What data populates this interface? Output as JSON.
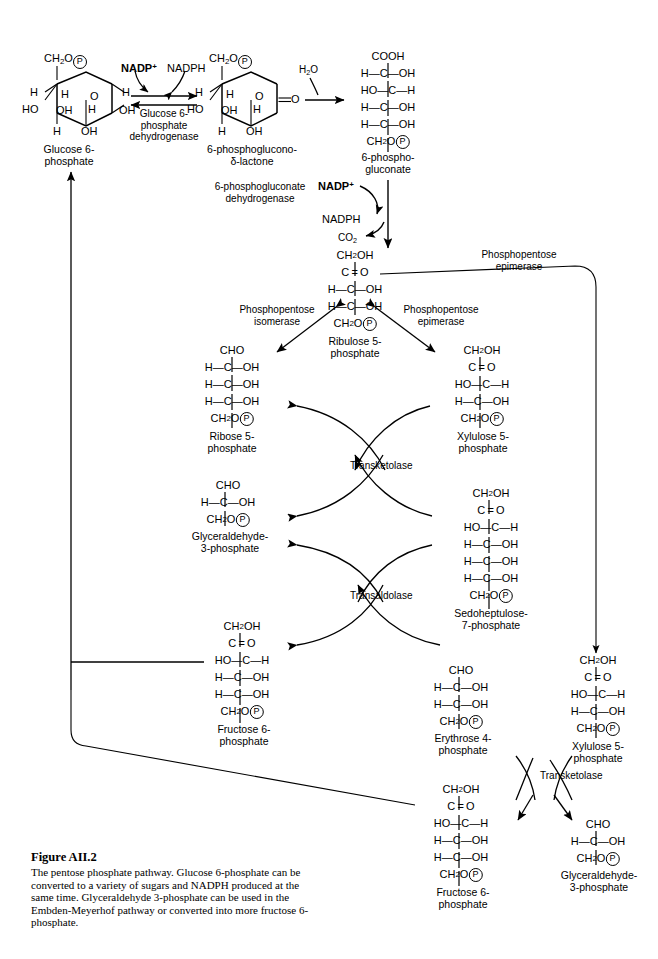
{
  "figure": {
    "number": "Figure AII.2",
    "caption": "The pentose phosphate pathway. Glucose 6-phosphate can be converted to a variety of sugars and NADPH produced at the same time. Glyceraldehyde 3-phosphate can be used in the Embden-Meyerhof pathway or converted into more fructose 6-phosphate."
  },
  "metabolites": {
    "glucose6p": {
      "name_line1": "Glucose 6-",
      "name_line2": "phosphate"
    },
    "lactone": {
      "name_line1": "6-phosphoglucono-",
      "name_line2": "δ-lactone"
    },
    "gluconate": {
      "name_line1": "6-phospho-",
      "name_line2": "gluconate",
      "rows": [
        "COOH",
        "H—C—OH",
        "HO—C—H",
        "H—C—OH",
        "H—C—OH",
        "CH2O-P"
      ]
    },
    "ribulose5p": {
      "name_line1": "Ribulose 5-",
      "name_line2": "phosphate",
      "rows": [
        "CH2OH",
        "C=O",
        "H—C—OH",
        "H—C—OH",
        "CH2O-P"
      ]
    },
    "ribose5p": {
      "name_line1": "Ribose 5-",
      "name_line2": "phosphate",
      "rows": [
        "CHO",
        "H—C—OH",
        "H—C—OH",
        "H—C—OH",
        "CH2O-P"
      ]
    },
    "xylulose5p_upper": {
      "name_line1": "Xylulose 5-",
      "name_line2": "phosphate",
      "rows": [
        "CH2OH",
        "C=O",
        "HO—C—H",
        "H—C—OH",
        "CH2O-P"
      ]
    },
    "g3p_mid": {
      "name_line1": "Glyceraldehyde-",
      "name_line2": "3-phosphate",
      "rows": [
        "CHO",
        "H—C—OH",
        "CH2O-P"
      ]
    },
    "sedoheptulose7p": {
      "name_line1": "Sedoheptulose-",
      "name_line2": "7-phosphate",
      "rows": [
        "CH2OH",
        "C=O",
        "HO—C—H",
        "H—C—OH",
        "H—C—OH",
        "H—C—OH",
        "CH2O-P"
      ]
    },
    "fructose6p_mid": {
      "name_line1": "Fructose 6-",
      "name_line2": "phosphate",
      "rows": [
        "CH2OH",
        "C=O",
        "HO—C—H",
        "H—C—OH",
        "H—C—OH",
        "CH2O-P"
      ]
    },
    "erythrose4p": {
      "name_line1": "Erythrose 4-",
      "name_line2": "phosphate",
      "rows": [
        "CHO",
        "H—C—OH",
        "H—C—OH",
        "CH2O-P"
      ]
    },
    "xylulose5p_lower": {
      "name_line1": "Xylulose 5-",
      "name_line2": "phosphate",
      "rows": [
        "CH2OH",
        "C=O",
        "HO—C—H",
        "H—C—OH",
        "CH2O-P"
      ]
    },
    "fructose6p_lower": {
      "name_line1": "Fructose 6-",
      "name_line2": "phosphate",
      "rows": [
        "CH2OH",
        "C=O",
        "HO—C—H",
        "H—C—OH",
        "H—C—OH",
        "CH2O-P"
      ]
    },
    "g3p_lower": {
      "name_line1": "Glyceraldehyde-",
      "name_line2": "3-phosphate",
      "rows": [
        "CHO",
        "H—C—OH",
        "CH2O-P"
      ]
    }
  },
  "enzymes": {
    "g6pdh_line1": "Glucose 6-",
    "g6pdh_line2": "phosphate",
    "g6pdh_line3": "dehydrogenase",
    "pgdh_line1": "6-phosphogluconate",
    "pgdh_line2": "dehydrogenase",
    "isomerase_line1": "Phosphopentose",
    "isomerase_line2": "isomerase",
    "epimerase_mid_line1": "Phosphopentose",
    "epimerase_mid_line2": "epimerase",
    "epimerase_top_line1": "Phosphopentose",
    "epimerase_top_line2": "epimerase",
    "transketolase_upper": "Transketolase",
    "transaldolase": "Transaldolase",
    "transketolase_lower": "Transketolase"
  },
  "cofactors": {
    "nadp_plus": "NADP",
    "nadp_plus_charge": "+",
    "nadph_top": "NADPH",
    "water": "H2O",
    "nadp_plus2": "NADP",
    "nadp_plus2_charge": "+",
    "nadph2": "NADPH",
    "co2": "CO2"
  },
  "atoms": {
    "H": "H",
    "OH": "OH",
    "HO": "HO",
    "O": "O",
    "P": "P"
  },
  "colors": {
    "line": "#000000",
    "background": "#ffffff"
  }
}
